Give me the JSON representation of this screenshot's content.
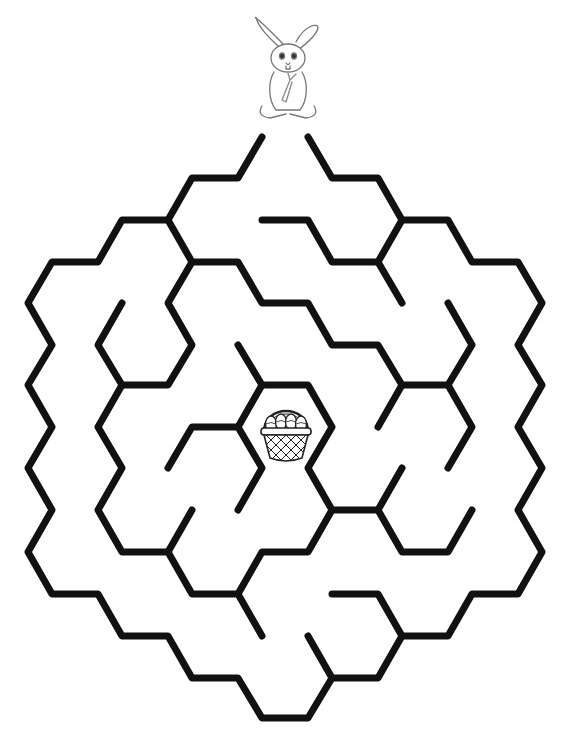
{
  "puzzle": {
    "type": "hexagonal maze",
    "start_character": "bunny-holding-carrot",
    "goal_item": "easter-basket-with-eggs",
    "wall_color": "#111111",
    "background_color": "#ffffff",
    "egg_count": 4
  }
}
